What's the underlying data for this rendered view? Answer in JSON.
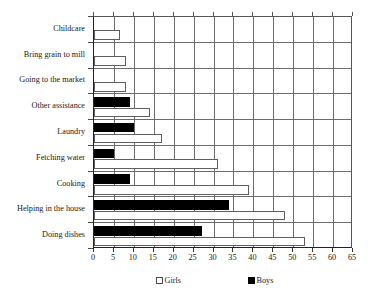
{
  "chart_data": {
    "type": "bar",
    "orientation": "horizontal",
    "title": "",
    "subtitle": "",
    "xlabel": "",
    "ylabel": "",
    "xlim": [
      0,
      65
    ],
    "xticks": [
      0,
      5,
      10,
      15,
      20,
      25,
      30,
      35,
      40,
      45,
      50,
      55,
      60,
      65
    ],
    "grid": true,
    "grid_axis": "x",
    "legend_position": "bottom",
    "categories": [
      "Childcare",
      "Bring grain to mill",
      "Going to the market",
      "Other assistance",
      "Laundry",
      "Fetching water",
      "Cooking",
      "Helping in the house",
      "Doing dishes"
    ],
    "series": [
      {
        "name": "Girls",
        "color": "#ffffff",
        "edgecolor": "#5e5e5e",
        "values": [
          6.5,
          8,
          8,
          14,
          17,
          31,
          39,
          48,
          53
        ]
      },
      {
        "name": "Boys",
        "color": "#000000",
        "edgecolor": "#000000",
        "values": [
          0,
          0,
          0,
          9,
          10,
          5,
          9,
          34,
          27
        ]
      }
    ]
  },
  "legend": {
    "items": [
      {
        "label": "Girls",
        "swatch": "hollow-square-icon"
      },
      {
        "label": "Boys",
        "swatch": "filled-square-icon"
      }
    ]
  },
  "axis": {
    "x_tick_labels": [
      "0",
      "5",
      "10",
      "15",
      "20",
      "25",
      "30",
      "35",
      "40",
      "45",
      "50",
      "55",
      "60",
      "65"
    ],
    "y_tick_labels": [
      "Childcare",
      "Bring grain to mill",
      "Going to the market",
      "Other assistance",
      "Laundry",
      "Fetching water",
      "Cooking",
      "Helping in the house",
      "Doing dishes"
    ]
  }
}
